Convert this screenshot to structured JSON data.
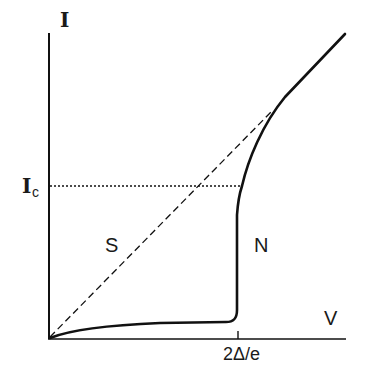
{
  "diagram": {
    "type": "I-V characteristic",
    "axes": {
      "y_label": "I",
      "x_label": "V"
    },
    "critical_current_label": {
      "main": "I",
      "subscript": "c"
    },
    "x_tick_label": "2Δ/e",
    "region_labels": {
      "superconducting": "S",
      "normal": "N"
    },
    "lines": {
      "dashed": "ohmic normal-state line",
      "dotted": "critical current level",
      "solid": "measured I-V curve"
    },
    "colors": {
      "stroke": "#111111",
      "background": "#ffffff"
    }
  }
}
